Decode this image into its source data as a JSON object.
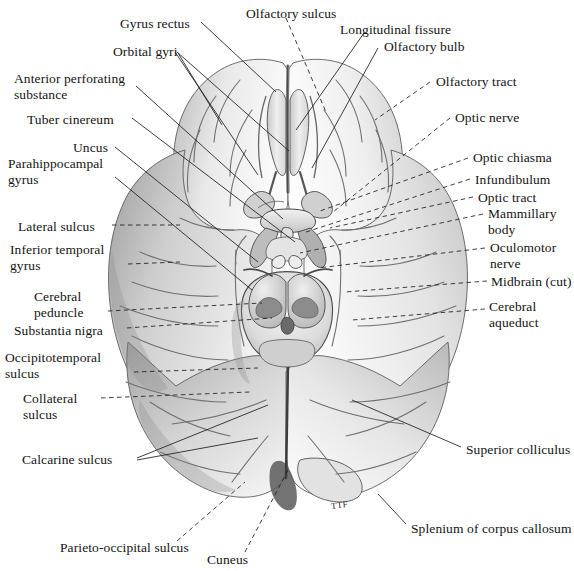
{
  "figure": {
    "artist_monogram": "TTF",
    "background_color": "#ffffff",
    "ink_color": "#141414"
  },
  "labels": [
    {
      "id": "gyrus-rectus",
      "text": "Gyrus rectus",
      "x": 120,
      "y": 16,
      "align": "left"
    },
    {
      "id": "olfactory-sulcus",
      "text": "Olfactory sulcus",
      "x": 246,
      "y": 6,
      "align": "left"
    },
    {
      "id": "longitudinal-fissure",
      "text": "Longitudinal fissure",
      "x": 340,
      "y": 22,
      "align": "left"
    },
    {
      "id": "orbital-gyri",
      "text": "Orbital gyri",
      "x": 113,
      "y": 44,
      "align": "left"
    },
    {
      "id": "olfactory-bulb",
      "text": "Olfactory bulb",
      "x": 384,
      "y": 39,
      "align": "left"
    },
    {
      "id": "anterior-perforating-substance",
      "text": "Anterior perforating\nsubstance",
      "x": 14,
      "y": 71,
      "align": "left"
    },
    {
      "id": "olfactory-tract",
      "text": "Olfactory tract",
      "x": 436,
      "y": 74,
      "align": "left"
    },
    {
      "id": "tuber-cinereum",
      "text": "Tuber cinereum",
      "x": 27,
      "y": 112,
      "align": "left"
    },
    {
      "id": "optic-nerve",
      "text": "Optic nerve",
      "x": 455,
      "y": 110,
      "align": "left"
    },
    {
      "id": "uncus",
      "text": "Uncus",
      "x": 73,
      "y": 140,
      "align": "left"
    },
    {
      "id": "optic-chiasma",
      "text": "Optic chiasma",
      "x": 473,
      "y": 150,
      "align": "left"
    },
    {
      "id": "parahippocampal-gyrus",
      "text": "Parahippocampal\ngyrus",
      "x": 8,
      "y": 156,
      "align": "left"
    },
    {
      "id": "infundibulum",
      "text": "Infundibulum",
      "x": 475,
      "y": 172,
      "align": "left"
    },
    {
      "id": "optic-tract",
      "text": "Optic tract",
      "x": 478,
      "y": 190,
      "align": "left"
    },
    {
      "id": "mammillary-body",
      "text": "Mammillary\nbody",
      "x": 488,
      "y": 206,
      "align": "left"
    },
    {
      "id": "lateral-sulcus",
      "text": "Lateral sulcus",
      "x": 18,
      "y": 219,
      "align": "left"
    },
    {
      "id": "oculomotor-nerve",
      "text": "Oculomotor\nnerve",
      "x": 490,
      "y": 240,
      "align": "left"
    },
    {
      "id": "inferior-temporal-gyrus",
      "text": "Inferior temporal\ngyrus",
      "x": 10,
      "y": 242,
      "align": "left"
    },
    {
      "id": "midbrain-cut",
      "text": "Midbrain (cut)",
      "x": 491,
      "y": 274,
      "align": "left"
    },
    {
      "id": "cerebral-peduncle",
      "text": "Cerebral\npeduncle",
      "x": 34,
      "y": 289,
      "align": "left"
    },
    {
      "id": "cerebral-aqueduct",
      "text": "Cerebral\naqueduct",
      "x": 489,
      "y": 299,
      "align": "left"
    },
    {
      "id": "substantia-nigra",
      "text": "Substantia nigra",
      "x": 14,
      "y": 323,
      "align": "left"
    },
    {
      "id": "occipitotemporal-sulcus",
      "text": "Occipitotemporal\nsulcus",
      "x": 5,
      "y": 350,
      "align": "left"
    },
    {
      "id": "collateral-sulcus",
      "text": "Collateral\nsulcus",
      "x": 23,
      "y": 391,
      "align": "left"
    },
    {
      "id": "superior-colliculus",
      "text": "Superior colliculus",
      "x": 466,
      "y": 442,
      "align": "left"
    },
    {
      "id": "calcarine-sulcus",
      "text": "Calcarine sulcus",
      "x": 22,
      "y": 452,
      "align": "left"
    },
    {
      "id": "splenium-of-corpus-callosum",
      "text": "Splenium of corpus callosum",
      "x": 411,
      "y": 521,
      "align": "left"
    },
    {
      "id": "parieto-occipital-sulcus",
      "text": "Parieto-occipital sulcus",
      "x": 60,
      "y": 540,
      "align": "left"
    },
    {
      "id": "cuneus",
      "text": "Cuneus",
      "x": 207,
      "y": 552,
      "align": "left"
    }
  ],
  "leaders": [
    {
      "id": "leader-gyrus-rectus",
      "d": "M 201 22 L 276 92",
      "dashed": false
    },
    {
      "id": "leader-olfactory-sulcus",
      "d": "M 286 18 L 326 112",
      "dashed": true
    },
    {
      "id": "leader-longitudinal-fissure",
      "d": "M 364 33 L 296 130",
      "dashed": false
    },
    {
      "id": "leader-orbital-gyri-a",
      "d": "M 175 52 L 258 175",
      "dashed": false
    },
    {
      "id": "leader-orbital-gyri-b",
      "d": "M 177 52 L 289 151",
      "dashed": false
    },
    {
      "id": "leader-orbital-gyri-c",
      "d": "M 178 53 L 222 125",
      "dashed": false
    },
    {
      "id": "leader-olfactory-bulb",
      "d": "M 378 48 L 312 168",
      "dashed": false
    },
    {
      "id": "leader-aps",
      "d": "M 136 86 L 283 219",
      "dashed": false
    },
    {
      "id": "leader-olfactory-tract",
      "d": "M 430 82 L 375 120",
      "dashed": true
    },
    {
      "id": "leader-tuber-cinereum",
      "d": "M 132 118 L 295 242",
      "dashed": false
    },
    {
      "id": "leader-optic-nerve",
      "d": "M 450 118 L 333 212",
      "dashed": true
    },
    {
      "id": "leader-uncus",
      "d": "M 115 147 L 258 262",
      "dashed": false
    },
    {
      "id": "leader-optic-chiasma",
      "d": "M 468 158 L 320 211",
      "dashed": true
    },
    {
      "id": "leader-parahippocampal",
      "d": "M 115 177 L 252 290",
      "dashed": false
    },
    {
      "id": "leader-infundibulum",
      "d": "M 470 179 L 306 232",
      "dashed": true
    },
    {
      "id": "leader-optic-tract",
      "d": "M 473 197 L 330 228",
      "dashed": true
    },
    {
      "id": "leader-mammillary-body",
      "d": "M 483 214 L 300 253",
      "dashed": true
    },
    {
      "id": "leader-lateral-sulcus",
      "d": "M 112 225 L 180 225",
      "dashed": true
    },
    {
      "id": "leader-oculomotor-nerve",
      "d": "M 485 248 L 318 268",
      "dashed": true
    },
    {
      "id": "leader-inferior-temporal-gyrus",
      "d": "M 128 264 L 180 262",
      "dashed": true
    },
    {
      "id": "leader-midbrain-cut",
      "d": "M 487 281 L 345 292",
      "dashed": true
    },
    {
      "id": "leader-cerebral-peduncle",
      "d": "M 108 311 L 262 303",
      "dashed": true
    },
    {
      "id": "leader-cerebral-aqueduct",
      "d": "M 485 309 L 352 320",
      "dashed": true
    },
    {
      "id": "leader-substantia-nigra",
      "d": "M 127 328 L 272 318",
      "dashed": true
    },
    {
      "id": "leader-occipitotemporal",
      "d": "M 134 372 L 258 368",
      "dashed": true
    },
    {
      "id": "leader-collateral-sulcus",
      "d": "M 101 398 L 250 392",
      "dashed": true
    },
    {
      "id": "leader-superior-colliculus",
      "d": "M 461 447 L 352 400",
      "dashed": false
    },
    {
      "id": "leader-calcarine-a",
      "d": "M 137 458 L 268 405",
      "dashed": false
    },
    {
      "id": "leader-calcarine-b",
      "d": "M 137 460 L 258 438",
      "dashed": false
    },
    {
      "id": "leader-splenium",
      "d": "M 406 524 L 378 494",
      "dashed": false
    },
    {
      "id": "leader-parieto-occipital",
      "d": "M 177 541 L 245 482",
      "dashed": true
    },
    {
      "id": "leader-cuneus",
      "d": "M 245 552 L 288 470",
      "dashed": true
    }
  ]
}
